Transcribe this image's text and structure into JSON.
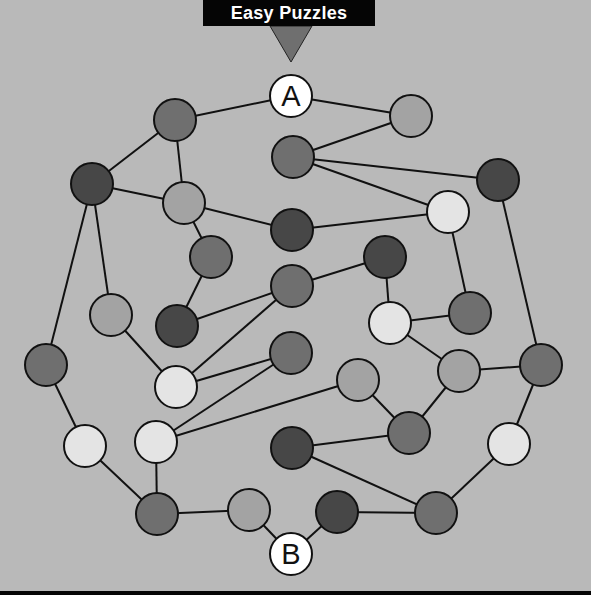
{
  "title": "Easy Puzzles",
  "colors": {
    "background": "#b9b9b9",
    "banner": "#050505",
    "pointer": "#6f6f6f",
    "edge": "#111111",
    "dark": "#474747",
    "mid": "#6f6f6f",
    "light": "#a3a3a3",
    "white": "#e4e4e4",
    "endpoint": "#ffffff"
  },
  "graph": {
    "radius": 21,
    "nodes": [
      {
        "id": "A",
        "x": 291,
        "y": 96,
        "shade": "endpoint",
        "label": "A"
      },
      {
        "id": "n1",
        "x": 175,
        "y": 120,
        "shade": "mid"
      },
      {
        "id": "n2",
        "x": 411,
        "y": 116,
        "shade": "light"
      },
      {
        "id": "n3",
        "x": 293,
        "y": 157,
        "shade": "mid"
      },
      {
        "id": "n4",
        "x": 92,
        "y": 184,
        "shade": "dark"
      },
      {
        "id": "n5",
        "x": 184,
        "y": 203,
        "shade": "light"
      },
      {
        "id": "n6",
        "x": 498,
        "y": 180,
        "shade": "dark"
      },
      {
        "id": "n7",
        "x": 448,
        "y": 212,
        "shade": "white"
      },
      {
        "id": "n8",
        "x": 292,
        "y": 230,
        "shade": "dark"
      },
      {
        "id": "n9",
        "x": 211,
        "y": 257,
        "shade": "mid"
      },
      {
        "id": "n10",
        "x": 385,
        "y": 257,
        "shade": "dark"
      },
      {
        "id": "n11",
        "x": 292,
        "y": 286,
        "shade": "mid"
      },
      {
        "id": "n12",
        "x": 111,
        "y": 315,
        "shade": "light"
      },
      {
        "id": "n13",
        "x": 177,
        "y": 326,
        "shade": "dark"
      },
      {
        "id": "n14",
        "x": 390,
        "y": 323,
        "shade": "white"
      },
      {
        "id": "n15",
        "x": 470,
        "y": 313,
        "shade": "mid"
      },
      {
        "id": "n16",
        "x": 291,
        "y": 353,
        "shade": "mid"
      },
      {
        "id": "n17",
        "x": 46,
        "y": 365,
        "shade": "mid"
      },
      {
        "id": "n18",
        "x": 176,
        "y": 387,
        "shade": "white"
      },
      {
        "id": "n19",
        "x": 358,
        "y": 380,
        "shade": "light"
      },
      {
        "id": "n20",
        "x": 459,
        "y": 371,
        "shade": "light"
      },
      {
        "id": "n21",
        "x": 541,
        "y": 365,
        "shade": "mid"
      },
      {
        "id": "n22",
        "x": 85,
        "y": 446,
        "shade": "white"
      },
      {
        "id": "n23",
        "x": 156,
        "y": 442,
        "shade": "white"
      },
      {
        "id": "n24",
        "x": 292,
        "y": 448,
        "shade": "dark"
      },
      {
        "id": "n25",
        "x": 409,
        "y": 433,
        "shade": "mid"
      },
      {
        "id": "n26",
        "x": 509,
        "y": 444,
        "shade": "white"
      },
      {
        "id": "n27",
        "x": 157,
        "y": 514,
        "shade": "mid"
      },
      {
        "id": "n28",
        "x": 249,
        "y": 510,
        "shade": "light"
      },
      {
        "id": "n29",
        "x": 337,
        "y": 512,
        "shade": "dark"
      },
      {
        "id": "n30",
        "x": 436,
        "y": 513,
        "shade": "mid"
      },
      {
        "id": "B",
        "x": 291,
        "y": 554,
        "shade": "endpoint",
        "label": "B"
      }
    ],
    "edges": [
      [
        "A",
        "n1"
      ],
      [
        "A",
        "n2"
      ],
      [
        "n2",
        "n3"
      ],
      [
        "n1",
        "n4"
      ],
      [
        "n1",
        "n5"
      ],
      [
        "n4",
        "n5"
      ],
      [
        "n4",
        "n12"
      ],
      [
        "n4",
        "n17"
      ],
      [
        "n5",
        "n8"
      ],
      [
        "n5",
        "n9"
      ],
      [
        "n3",
        "n6"
      ],
      [
        "n3",
        "n7"
      ],
      [
        "n8",
        "n7"
      ],
      [
        "n7",
        "n15"
      ],
      [
        "n6",
        "n21"
      ],
      [
        "n9",
        "n13"
      ],
      [
        "n13",
        "n11"
      ],
      [
        "n11",
        "n10"
      ],
      [
        "n11",
        "n18"
      ],
      [
        "n10",
        "n14"
      ],
      [
        "n14",
        "n15"
      ],
      [
        "n14",
        "n20"
      ],
      [
        "n12",
        "n18"
      ],
      [
        "n18",
        "n16"
      ],
      [
        "n16",
        "n23"
      ],
      [
        "n23",
        "n19"
      ],
      [
        "n19",
        "n25"
      ],
      [
        "n20",
        "n25"
      ],
      [
        "n20",
        "n21"
      ],
      [
        "n21",
        "n26"
      ],
      [
        "n24",
        "n25"
      ],
      [
        "n24",
        "n30"
      ],
      [
        "n26",
        "n30"
      ],
      [
        "n17",
        "n22"
      ],
      [
        "n22",
        "n27"
      ],
      [
        "n23",
        "n27"
      ],
      [
        "n27",
        "n28"
      ],
      [
        "n28",
        "B"
      ],
      [
        "B",
        "n29"
      ],
      [
        "n29",
        "n30"
      ]
    ]
  }
}
